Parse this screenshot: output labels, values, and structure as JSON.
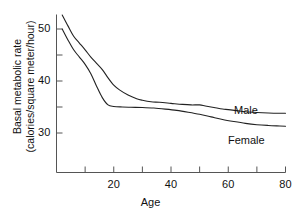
{
  "chart_data": {
    "type": "line",
    "title": "",
    "xlabel": "Age",
    "ylabel": "Basal metabolic rate (calories/square meter/hour)",
    "ylabel_line1": "Basal metabolic rate",
    "ylabel_line2": "(calories/square meter/hour)",
    "xlim": [
      0,
      80
    ],
    "ylim": [
      26,
      54
    ],
    "grid": false,
    "legend_position": "inline-right",
    "x_ticks_major": [
      20,
      40,
      60,
      80
    ],
    "x_ticks_minor": [
      10,
      30,
      50,
      70
    ],
    "x_tick_labels": [
      "20",
      "40",
      "60",
      "80"
    ],
    "y_ticks_major": [
      30,
      40,
      50
    ],
    "y_ticks_minor": [
      35,
      45
    ],
    "y_tick_labels": [
      "30",
      "40",
      "50"
    ],
    "line_color": "#222222",
    "axis_color": "#555555",
    "series": [
      {
        "name": "Male",
        "label": "Male",
        "x": [
          2,
          4,
          6,
          8,
          10,
          12,
          14,
          16,
          18,
          20,
          22,
          25,
          28,
          30,
          33,
          36,
          40,
          44,
          47,
          50,
          52,
          55,
          58,
          60,
          63,
          66,
          70,
          74,
          78,
          80
        ],
        "values": [
          52.7,
          50.6,
          48.6,
          47.3,
          46.0,
          44.6,
          43.4,
          42.2,
          40.6,
          39.2,
          38.3,
          37.3,
          36.6,
          36.3,
          36.0,
          35.9,
          35.7,
          35.5,
          35.4,
          35.4,
          35.2,
          34.9,
          34.6,
          34.5,
          34.3,
          34.1,
          33.95,
          33.85,
          33.8,
          33.8
        ]
      },
      {
        "name": "Female",
        "label": "Female",
        "x": [
          2,
          4,
          6,
          8,
          10,
          12,
          14,
          16,
          18,
          20,
          23,
          26,
          30,
          34,
          38,
          42,
          46,
          50,
          54,
          58,
          62,
          66,
          70,
          74,
          78,
          80
        ],
        "values": [
          50.0,
          47.9,
          46.0,
          44.6,
          43.2,
          41.4,
          39.0,
          36.8,
          35.4,
          35.1,
          35.0,
          34.95,
          34.9,
          34.8,
          34.6,
          34.35,
          34.0,
          33.6,
          33.1,
          32.6,
          32.2,
          31.85,
          31.6,
          31.45,
          31.35,
          31.3
        ]
      }
    ]
  },
  "axes": {
    "x_title": "Age",
    "y_title_line1": "Basal metabolic rate",
    "y_title_line2": "(calories/square meter/hour)"
  },
  "labels": {
    "male": "Male",
    "female": "Female"
  }
}
